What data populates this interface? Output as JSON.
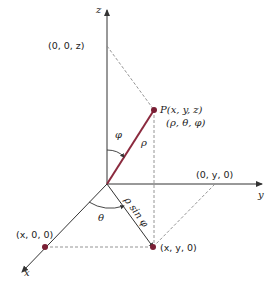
{
  "diagram": {
    "type": "spherical-coordinates",
    "colors": {
      "axis": "#333333",
      "rho": "#8b2a3e",
      "point": "#7a1f35",
      "dashed": "#888888"
    },
    "axes": {
      "x": "x",
      "y": "y",
      "z": "z"
    },
    "points": {
      "P": "P(x, y, z)",
      "P_spherical": "(ρ, θ, φ)",
      "z_proj": "(0, 0, z)",
      "y_proj": "(0, y, 0)",
      "x_proj": "(x, 0, 0)",
      "xy_proj": "(x, y, 0)"
    },
    "symbols": {
      "rho": "ρ",
      "phi": "φ",
      "theta": "θ",
      "rho_sin_phi": "ρ sin φ"
    }
  }
}
